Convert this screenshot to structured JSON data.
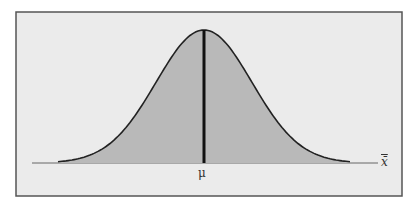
{
  "chart_data": {
    "type": "area",
    "title": "",
    "xlabel": "x̄",
    "ylabel": "",
    "tick_labels": [
      "μ"
    ],
    "mean_marker": {
      "label": "μ",
      "position": "center"
    },
    "curve": "normal",
    "grid": false,
    "legend": "none"
  },
  "labels": {
    "mean": "μ",
    "axis": "x̄"
  },
  "colors": {
    "panel_bg": "#ebebeb",
    "fill": "#b9b9b9",
    "curve": "#222222",
    "border": "#555555"
  }
}
